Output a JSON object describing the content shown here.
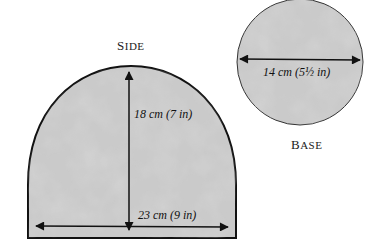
{
  "side": {
    "title_first": "S",
    "title_rest": "IDE",
    "height_label": "18 cm (7 in)",
    "width_label": "23 cm (9 in)"
  },
  "base": {
    "title_first": "B",
    "title_rest": "ASE",
    "diameter_label": "14 cm (5½ in)"
  },
  "colors": {
    "fill": "#c9c9c9",
    "stroke": "#111111"
  }
}
